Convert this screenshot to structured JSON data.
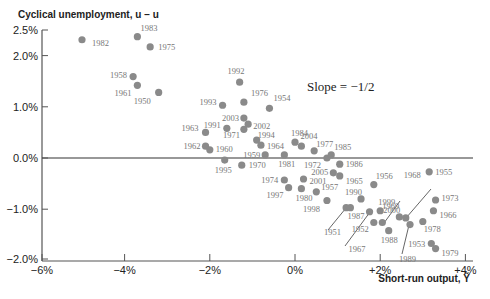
{
  "chart_data": {
    "type": "scatter",
    "title": "",
    "xlabel": "Short-run output, Ỹ",
    "ylabel": "Cyclical unemployment, u − u",
    "xlim": [
      -6,
      4
    ],
    "ylim": [
      -2.0,
      2.5
    ],
    "x_ticks": [
      "−6%",
      "−4%",
      "−2%",
      "0%",
      "+2%",
      "+4%"
    ],
    "x_tick_values": [
      -6,
      -4,
      -2,
      0,
      2,
      4
    ],
    "y_ticks": [
      "2.5%",
      "2.0%",
      "1.0%",
      "0.0%",
      "−1.0%",
      "−2.0%"
    ],
    "y_tick_values": [
      2.5,
      2.0,
      1.0,
      0.0,
      -1.0,
      -2.0
    ],
    "grid": false,
    "reference_line": {
      "y": 0,
      "label": "zero line"
    },
    "annotation": "Slope = −1/2",
    "points": [
      {
        "label": "1982",
        "x": -5.0,
        "y": 2.31
      },
      {
        "label": "1983",
        "x": -3.7,
        "y": 2.37
      },
      {
        "label": "1975",
        "x": -3.4,
        "y": 2.17
      },
      {
        "label": "1958",
        "x": -3.8,
        "y": 1.59
      },
      {
        "label": "1961",
        "x": -3.7,
        "y": 1.42
      },
      {
        "label": "1950",
        "x": -3.2,
        "y": 1.28
      },
      {
        "label": "1992",
        "x": -1.3,
        "y": 1.48
      },
      {
        "label": "1976",
        "x": -1.2,
        "y": 1.09
      },
      {
        "label": "1993",
        "x": -1.7,
        "y": 1.03
      },
      {
        "label": "1954",
        "x": -0.6,
        "y": 0.97
      },
      {
        "label": "2003",
        "x": -1.2,
        "y": 0.78
      },
      {
        "label": "2002",
        "x": -1.1,
        "y": 0.66
      },
      {
        "label": "1991",
        "x": -1.6,
        "y": 0.58
      },
      {
        "label": "1963",
        "x": -2.1,
        "y": 0.5
      },
      {
        "label": "1971",
        "x": -1.2,
        "y": 0.56
      },
      {
        "label": "1994",
        "x": -0.9,
        "y": 0.35
      },
      {
        "label": "1964",
        "x": -0.8,
        "y": 0.25
      },
      {
        "label": "1962",
        "x": -2.1,
        "y": 0.23
      },
      {
        "label": "1960",
        "x": -2.0,
        "y": 0.16
      },
      {
        "label": "1984",
        "x": 0.0,
        "y": 0.31
      },
      {
        "label": "2004",
        "x": 0.15,
        "y": 0.23
      },
      {
        "label": "1977",
        "x": 0.45,
        "y": 0.14
      },
      {
        "label": "1959",
        "x": -0.7,
        "y": 0.06
      },
      {
        "label": "1981",
        "x": -0.25,
        "y": 0.06
      },
      {
        "label": "1972",
        "x": 0.75,
        "y": 0.0
      },
      {
        "label": "1985",
        "x": 0.85,
        "y": 0.06
      },
      {
        "label": "1995",
        "x": -1.65,
        "y": -0.04
      },
      {
        "label": "1970",
        "x": -1.25,
        "y": -0.14
      },
      {
        "label": "1986",
        "x": 1.05,
        "y": -0.12
      },
      {
        "label": "2005",
        "x": 0.9,
        "y": -0.29
      },
      {
        "label": "1965",
        "x": 1.05,
        "y": -0.35
      },
      {
        "label": "1974",
        "x": -0.25,
        "y": -0.43
      },
      {
        "label": "2001",
        "x": 0.2,
        "y": -0.41
      },
      {
        "label": "1997",
        "x": -0.15,
        "y": -0.58
      },
      {
        "label": "1980",
        "x": 0.15,
        "y": -0.6
      },
      {
        "label": "1957",
        "x": 0.5,
        "y": -0.66
      },
      {
        "label": "1998",
        "x": 0.75,
        "y": -0.83
      },
      {
        "label": "1990",
        "x": 1.55,
        "y": -0.8
      },
      {
        "label": "1956",
        "x": 1.85,
        "y": -0.52
      },
      {
        "label": "1951",
        "x": 1.2,
        "y": -0.97
      },
      {
        "label": "1987",
        "x": 1.3,
        "y": -0.97
      },
      {
        "label": "1999",
        "x": 2.0,
        "y": -1.03
      },
      {
        "label": "1967",
        "x": 1.75,
        "y": -1.05
      },
      {
        "label": "1952",
        "x": 1.85,
        "y": -1.26
      },
      {
        "label": "1969",
        "x": 2.05,
        "y": -1.26
      },
      {
        "label": "2000",
        "x": 2.45,
        "y": -1.15
      },
      {
        "label": "1968",
        "x": 2.6,
        "y": -1.17
      },
      {
        "label": "1989",
        "x": 2.7,
        "y": -1.3
      },
      {
        "label": "1988",
        "x": 2.2,
        "y": -1.42
      },
      {
        "label": "1978",
        "x": 3.0,
        "y": -1.24
      },
      {
        "label": "1955",
        "x": 3.15,
        "y": -0.27
      },
      {
        "label": "1973",
        "x": 3.3,
        "y": -0.82
      },
      {
        "label": "1966",
        "x": 3.25,
        "y": -1.03
      },
      {
        "label": "1953",
        "x": 3.2,
        "y": -1.67
      },
      {
        "label": "1979",
        "x": 3.3,
        "y": -1.77
      }
    ],
    "label_offsets": {
      "1982": [
        10,
        6,
        "start"
      ],
      "1983": [
        3,
        -6,
        "start"
      ],
      "1975": [
        8,
        3,
        "start"
      ],
      "1958": [
        -6,
        1,
        "end"
      ],
      "1961": [
        -6,
        11,
        "end"
      ],
      "1950": [
        -8,
        12,
        "end"
      ],
      "1992": [
        -12,
        -8,
        "start"
      ],
      "1976": [
        7,
        -6,
        "start"
      ],
      "1993": [
        -6,
        0,
        "end"
      ],
      "1954": [
        4,
        -7,
        "start"
      ],
      "2003": [
        -5,
        3,
        "end"
      ],
      "2002": [
        5,
        5,
        "start"
      ],
      "1991": [
        -6,
        0,
        "end"
      ],
      "1963": [
        -7,
        -1,
        "end"
      ],
      "1971": [
        -4,
        9,
        "end"
      ],
      "1994": [
        1,
        -2,
        "start"
      ],
      "1964": [
        6,
        4,
        "start"
      ],
      "1962": [
        -5,
        3,
        "end"
      ],
      "1960": [
        6,
        2,
        "start"
      ],
      "1984": [
        -4,
        -6,
        "start"
      ],
      "2004": [
        -1,
        -7,
        "start"
      ],
      "1977": [
        2,
        -4,
        "start"
      ],
      "1959": [
        -5,
        3,
        "end"
      ],
      "1981": [
        -6,
        12,
        "start"
      ],
      "1972": [
        -6,
        10,
        "end"
      ],
      "1985": [
        3,
        -5,
        "start"
      ],
      "1995": [
        -10,
        13,
        "start"
      ],
      "1970": [
        7,
        3,
        "start"
      ],
      "1986": [
        6,
        3,
        "start"
      ],
      "2005": [
        -5,
        2,
        "end"
      ],
      "1965": [
        6,
        8,
        "start"
      ],
      "1974": [
        -6,
        3,
        "end"
      ],
      "2001": [
        6,
        5,
        "start"
      ],
      "1997": [
        -5,
        10,
        "end"
      ],
      "1980": [
        -6,
        12,
        "start"
      ],
      "1957": [
        5,
        -2,
        "start"
      ],
      "1998": [
        -7,
        12,
        "end"
      ],
      "1990": [
        -16,
        -4,
        "start"
      ],
      "1956": [
        2,
        -6,
        "start"
      ],
      "1951": [
        -5,
        27,
        "end"
      ],
      "1987": [
        -3,
        11,
        "start"
      ],
      "1999": [
        -2,
        -6,
        "start"
      ],
      "1967": [
        -4,
        40,
        "end"
      ],
      "1952": [
        -5,
        9,
        "end"
      ],
      "1969": [
        0,
        -14,
        "start"
      ],
      "2000": [
        -16,
        -4,
        "start"
      ],
      "1968": [
        -2,
        -40,
        "start"
      ],
      "1989": [
        -11,
        37,
        "start"
      ],
      "1988": [
        -8,
        12,
        "start"
      ],
      "1978": [
        1,
        11,
        "start"
      ],
      "1955": [
        6,
        3,
        "start"
      ],
      "1973": [
        6,
        1,
        "start"
      ],
      "1966": [
        6,
        7,
        "start"
      ],
      "1953": [
        -6,
        3,
        "end"
      ],
      "1979": [
        6,
        7,
        "start"
      ]
    },
    "leader_lines": [
      {
        "label": "1951",
        "from": [
          346,
          208
        ],
        "to": [
          328,
          230
        ]
      },
      {
        "label": "1967",
        "from": [
          370,
          212
        ],
        "to": [
          345,
          246
        ]
      },
      {
        "label": "1969",
        "from": [
          384,
          223
        ],
        "to": [
          400,
          201
        ]
      },
      {
        "label": "1968",
        "from": [
          406,
          218
        ],
        "to": [
          431,
          189
        ]
      },
      {
        "label": "1989",
        "from": [
          409,
          225
        ],
        "to": [
          402,
          254
        ]
      }
    ],
    "colors": {
      "point": "#8a8a8a",
      "label": "#777777",
      "axis": "#555555",
      "text": "#222222"
    }
  }
}
